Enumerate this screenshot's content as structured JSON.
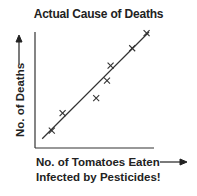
{
  "chart_data": {
    "type": "scatter",
    "title": "Actual Cause of Deaths",
    "xlabel": "No. of Tomatoes Eaten Infected by Pesticides!",
    "xlabel_lines": [
      "No. of Tomatoes Eaten",
      "Infected by Pesticides!"
    ],
    "ylabel": "No. of Deaths",
    "marker": "x",
    "grid": false,
    "legend": null,
    "xticks": [],
    "yticks": [],
    "xlim": [
      0,
      10
    ],
    "ylim": [
      0,
      10
    ],
    "points": [
      {
        "x": 1.4,
        "y": 1.5
      },
      {
        "x": 2.3,
        "y": 3.0
      },
      {
        "x": 5.1,
        "y": 4.3
      },
      {
        "x": 6.0,
        "y": 5.8
      },
      {
        "x": 6.3,
        "y": 7.1
      },
      {
        "x": 8.1,
        "y": 8.6
      },
      {
        "x": 9.3,
        "y": 9.9
      }
    ],
    "trendline": {
      "x0": 0.6,
      "y0": 0.8,
      "x1": 9.5,
      "y1": 10.0
    },
    "annotations": [
      "arrow pointing up next to y-axis label",
      "arrow pointing right next to x-axis label"
    ]
  },
  "text": {
    "title": "Actual Cause of Deaths",
    "ylabel": "No. of Deaths",
    "xlabel_line1": "No. of Tomatoes Eaten",
    "xlabel_line2": "Infected by Pesticides!"
  },
  "colors": {
    "ink": "#222222",
    "background": "#ffffff"
  }
}
